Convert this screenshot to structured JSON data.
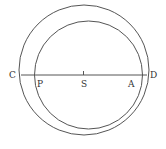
{
  "diagram": {
    "type": "eccentric-circles",
    "outer_circle": {
      "cx": 84,
      "cy": 70,
      "r": 65
    },
    "inner_circle": {
      "cx": 88.5,
      "cy": 75,
      "r": 54
    },
    "line": {
      "y": 75,
      "x1": 21,
      "x2": 147
    },
    "labels": {
      "C": "C",
      "P": "P",
      "S": "S",
      "A": "A",
      "D": "D"
    },
    "stroke_color": "#555555"
  }
}
